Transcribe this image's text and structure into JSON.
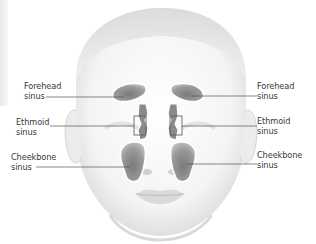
{
  "figure": {
    "labels_left": [
      {
        "id": "forehead",
        "line1": "Forehead",
        "line2": "sinus"
      },
      {
        "id": "ethmoid",
        "line1": "Ethmoid",
        "line2": "sinus"
      },
      {
        "id": "cheekbone",
        "line1": "Cheekbone",
        "line2": "sinus"
      }
    ],
    "labels_right": [
      {
        "id": "forehead",
        "line1": "Forehead",
        "line2": "sinus"
      },
      {
        "id": "ethmoid",
        "line1": "Ethmoid",
        "line2": "sinus"
      },
      {
        "id": "cheekbone",
        "line1": "Cheekbone",
        "line2": "sinus"
      }
    ]
  },
  "colors": {
    "skin_shadow": "#c9c9c9",
    "sinus_fill": "#8d8d8d",
    "sinus_light": "#b8b8b8",
    "label_text": "#3a3a3a",
    "leader_line": "#555555"
  }
}
